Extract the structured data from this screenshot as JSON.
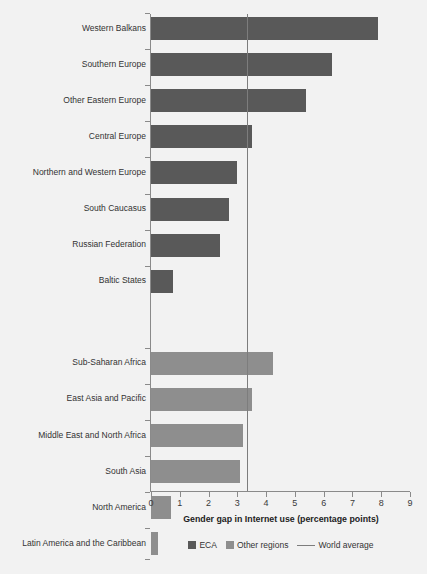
{
  "chart_data": {
    "type": "bar",
    "orientation": "horizontal",
    "title": "",
    "xlabel": "Gender gap in Internet use (percentage points)",
    "ylabel": "",
    "xlim": [
      0,
      9
    ],
    "xticks": [
      "0",
      "1",
      "2",
      "3",
      "4",
      "5",
      "6",
      "7",
      "8",
      "9"
    ],
    "grid": false,
    "legend_position": "bottom",
    "reference_line": {
      "label": "World average",
      "value": 3.35,
      "color": "#7d7d7d"
    },
    "series": [
      {
        "name": "ECA",
        "color": "#595959",
        "categories": [
          "Western Balkans",
          "Southern Europe",
          "Other Eastern Europe",
          "Central Europe",
          "Northern and Western Europe",
          "South Caucasus",
          "Russian Federation",
          "Baltic States"
        ],
        "values": [
          7.9,
          6.3,
          5.4,
          3.5,
          3.0,
          2.7,
          2.4,
          0.75
        ]
      },
      {
        "name": "Other regions",
        "color": "#8e8e8e",
        "categories": [
          "Sub-Saharan Africa",
          "East Asia and Pacific",
          "Middle East and North Africa",
          "South Asia",
          "North America",
          "Latin America and the Caribbean"
        ],
        "values": [
          4.25,
          3.5,
          3.2,
          3.1,
          0.7,
          0.25
        ]
      }
    ],
    "legend": [
      {
        "label": "ECA",
        "type": "swatch",
        "color": "#595959"
      },
      {
        "label": "Other regions",
        "type": "swatch",
        "color": "#8e8e8e"
      },
      {
        "label": "World average",
        "type": "line",
        "color": "#7d7d7d"
      }
    ]
  },
  "colors": {
    "background": "#f2f2f2",
    "eca": "#595959",
    "other_regions": "#8e8e8e",
    "axis": "#8a8a8a",
    "reference_line": "#7d7d7d",
    "text": "#333333"
  }
}
